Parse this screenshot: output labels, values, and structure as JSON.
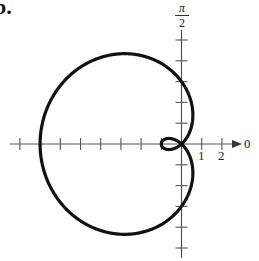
{
  "figure": {
    "part_label": "b.",
    "top_axis_label_numerator": "π",
    "top_axis_label_denominator": "2",
    "polar_axis_label": "0",
    "tick_labels": [
      "1",
      "2"
    ]
  },
  "colors": {
    "curve": "#111111",
    "axis": "#555555",
    "background": "#ffffff"
  },
  "chart_data": {
    "type": "line",
    "title": "",
    "coordinate_system": "polar",
    "equation": "r = 3 - 4cos(θ)",
    "xlabel": "",
    "ylabel": "",
    "polar_axis_labels": {
      "0": "0",
      "pi_over_2": "π/2"
    },
    "x_tick_labels": [
      "1",
      "2"
    ],
    "xlim": [
      -8.5,
      3.5
    ],
    "ylim": [
      -5.5,
      6
    ],
    "grid": false,
    "legend": null,
    "key_points": [
      {
        "theta": "0",
        "r": -1
      },
      {
        "theta": "π/2",
        "r": 3
      },
      {
        "theta": "π",
        "r": 7
      },
      {
        "theta": "3π/2",
        "r": 3
      }
    ],
    "features": {
      "outer_loop_leftmost_x": -7,
      "inner_loop_leftmost_x": -1,
      "vertical_intercepts": [
        3,
        -3
      ]
    }
  }
}
